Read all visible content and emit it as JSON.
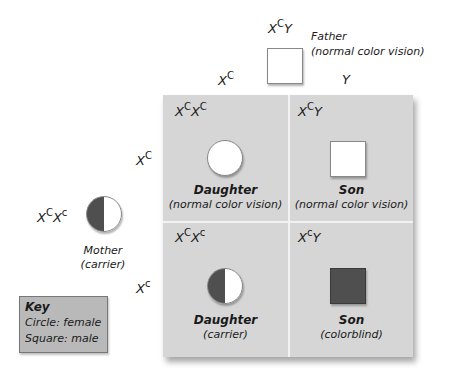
{
  "father": {
    "genotype_base": "X",
    "genotype_sup": "C",
    "genotype_tail": "Y",
    "label": "Father",
    "sublabel": "(normal color vision)",
    "symbol": "square",
    "fill": "white"
  },
  "mother": {
    "genotype_base": "X",
    "genotype_sup": "C",
    "genotype_base2": "X",
    "genotype_sup2": "c",
    "label": "Mother",
    "sublabel": "(carrier)",
    "symbol": "circle",
    "fill": "half"
  },
  "column_headers": [
    {
      "base": "X",
      "sup": "C"
    },
    {
      "base": "Y",
      "sup": ""
    }
  ],
  "row_headers": [
    {
      "base": "X",
      "sup": "C"
    },
    {
      "base": "X",
      "sup": "c"
    }
  ],
  "cells": [
    {
      "g1": "X",
      "s1": "C",
      "g2": "X",
      "s2": "C",
      "title": "Daughter",
      "subtitle": "(normal color vision)",
      "symbol": "circle",
      "fill": "white"
    },
    {
      "g1": "X",
      "s1": "C",
      "g2": "Y",
      "s2": "",
      "title": "Son",
      "subtitle": "(normal color vision)",
      "symbol": "square",
      "fill": "white"
    },
    {
      "g1": "X",
      "s1": "C",
      "g2": "X",
      "s2": "c",
      "title": "Daughter",
      "subtitle": "(carrier)",
      "symbol": "circle",
      "fill": "half"
    },
    {
      "g1": "X",
      "s1": "c",
      "g2": "Y",
      "s2": "",
      "title": "Son",
      "subtitle": "(colorblind)",
      "symbol": "square",
      "fill": "dark"
    }
  ],
  "key": {
    "title": "Key",
    "line1": "Circle: female",
    "line2": "Square: male"
  },
  "colors": {
    "grid_bg": "#d6d6d6",
    "affected": "#4f4f4f",
    "key_bg": "#b9b9b9"
  }
}
